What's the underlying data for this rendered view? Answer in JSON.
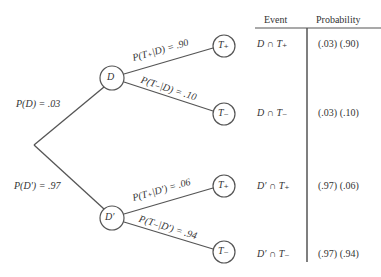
{
  "tree": {
    "root_branches": [
      {
        "label": "P(D) = .03",
        "node": "D"
      },
      {
        "label": "P(D′) = .97",
        "node": "D′"
      }
    ],
    "nodes": {
      "D": "D",
      "Dprime": "D′",
      "T_plus_1": "T₊",
      "T_minus_1": "T₋",
      "T_plus_2": "T₊",
      "T_minus_2": "T₋"
    },
    "branches": [
      {
        "label": "P(T₊|D) = .90"
      },
      {
        "label": "P(T₋|D) = .10"
      },
      {
        "label": "P(T₊|D′) = .06"
      },
      {
        "label": "P(T₋|D′) = .94"
      }
    ]
  },
  "table": {
    "headers": {
      "event": "Event",
      "probability": "Probability"
    },
    "rows": [
      {
        "event": "D ∩ T₊",
        "probability": "(.03) (.90)"
      },
      {
        "event": "D ∩ T₋",
        "probability": "(.03) (.10)"
      },
      {
        "event": "D′ ∩ T₊",
        "probability": "(.97) (.06)"
      },
      {
        "event": "D′ ∩ T₋",
        "probability": "(.97) (.94)"
      }
    ]
  }
}
